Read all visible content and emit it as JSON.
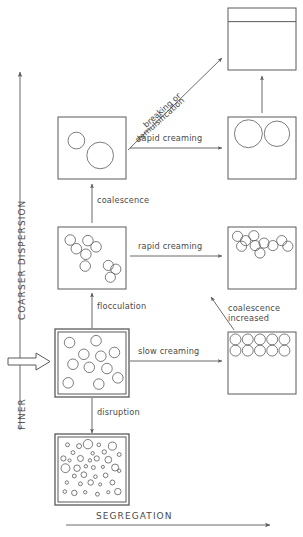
{
  "diagram": {
    "axes": {
      "vertical": {
        "top_label": "COARSER DISPERSION",
        "bottom_label": "FINER",
        "direction": "up",
        "name": "dispersion-axis"
      },
      "horizontal": {
        "label": "SEGREGATION",
        "direction": "right",
        "name": "segregation-axis"
      }
    },
    "input_arrow": {
      "name": "input-block-arrow",
      "points_to": "initial-emulsion"
    },
    "states": [
      {
        "id": "separated-phases",
        "name": "state-separated-phases",
        "caption": "",
        "x": 228,
        "y": 8,
        "w": 68,
        "h": 62,
        "kind": "two-phase",
        "phase_line_y": 0.22,
        "droplets": []
      },
      {
        "id": "coalesced-drops",
        "name": "state-coalesced-drops",
        "caption": "",
        "x": 58,
        "y": 117,
        "w": 68,
        "h": 62,
        "kind": "droplets",
        "droplets": [
          {
            "cx": 0.27,
            "cy": 0.38,
            "r": 0.135
          },
          {
            "cx": 0.62,
            "cy": 0.62,
            "r": 0.215
          }
        ]
      },
      {
        "id": "creamed-coalesced",
        "name": "state-creamed-coalesced",
        "caption": "",
        "x": 228,
        "y": 117,
        "w": 68,
        "h": 62,
        "kind": "droplets",
        "droplets": [
          {
            "cx": 0.3,
            "cy": 0.27,
            "r": 0.225
          },
          {
            "cx": 0.72,
            "cy": 0.27,
            "r": 0.205
          }
        ]
      },
      {
        "id": "flocculated",
        "name": "state-flocculated",
        "caption": "",
        "x": 58,
        "y": 227,
        "w": 68,
        "h": 62,
        "kind": "droplets",
        "droplets": [
          {
            "cx": 0.18,
            "cy": 0.21,
            "r": 0.085
          },
          {
            "cx": 0.27,
            "cy": 0.35,
            "r": 0.085
          },
          {
            "cx": 0.41,
            "cy": 0.44,
            "r": 0.085
          },
          {
            "cx": 0.44,
            "cy": 0.22,
            "r": 0.085
          },
          {
            "cx": 0.56,
            "cy": 0.32,
            "r": 0.085
          },
          {
            "cx": 0.4,
            "cy": 0.63,
            "r": 0.085
          },
          {
            "cx": 0.74,
            "cy": 0.62,
            "r": 0.082
          },
          {
            "cx": 0.85,
            "cy": 0.68,
            "r": 0.082
          },
          {
            "cx": 0.77,
            "cy": 0.81,
            "r": 0.082
          }
        ]
      },
      {
        "id": "flocculated-creamed",
        "name": "state-flocculated-creamed",
        "caption": "",
        "x": 228,
        "y": 227,
        "w": 68,
        "h": 62,
        "kind": "droplets",
        "droplets": [
          {
            "cx": 0.14,
            "cy": 0.15,
            "r": 0.082
          },
          {
            "cx": 0.26,
            "cy": 0.22,
            "r": 0.082
          },
          {
            "cx": 0.38,
            "cy": 0.14,
            "r": 0.082
          },
          {
            "cx": 0.4,
            "cy": 0.3,
            "r": 0.082
          },
          {
            "cx": 0.2,
            "cy": 0.31,
            "r": 0.082
          },
          {
            "cx": 0.53,
            "cy": 0.26,
            "r": 0.082
          },
          {
            "cx": 0.66,
            "cy": 0.3,
            "r": 0.082
          },
          {
            "cx": 0.79,
            "cy": 0.22,
            "r": 0.082
          },
          {
            "cx": 0.88,
            "cy": 0.31,
            "r": 0.082
          },
          {
            "cx": 0.47,
            "cy": 0.42,
            "r": 0.082
          }
        ]
      },
      {
        "id": "initial-emulsion",
        "name": "state-initial-emulsion",
        "caption": "",
        "x": 58,
        "y": 332,
        "w": 68,
        "h": 62,
        "kind": "droplets",
        "highlighted": true,
        "droplets": [
          {
            "cx": 0.17,
            "cy": 0.17,
            "r": 0.085
          },
          {
            "cx": 0.56,
            "cy": 0.14,
            "r": 0.085
          },
          {
            "cx": 0.38,
            "cy": 0.36,
            "r": 0.085
          },
          {
            "cx": 0.63,
            "cy": 0.39,
            "r": 0.085
          },
          {
            "cx": 0.83,
            "cy": 0.33,
            "r": 0.085
          },
          {
            "cx": 0.22,
            "cy": 0.52,
            "r": 0.085
          },
          {
            "cx": 0.46,
            "cy": 0.57,
            "r": 0.085
          },
          {
            "cx": 0.72,
            "cy": 0.59,
            "r": 0.085
          },
          {
            "cx": 0.15,
            "cy": 0.82,
            "r": 0.085
          },
          {
            "cx": 0.6,
            "cy": 0.84,
            "r": 0.085
          },
          {
            "cx": 0.88,
            "cy": 0.74,
            "r": 0.085
          }
        ]
      },
      {
        "id": "creamed-packed",
        "name": "state-creamed-packed",
        "caption": "",
        "x": 228,
        "y": 332,
        "w": 68,
        "h": 62,
        "kind": "droplets",
        "droplets": [
          {
            "cx": 0.11,
            "cy": 0.12,
            "r": 0.088
          },
          {
            "cx": 0.29,
            "cy": 0.12,
            "r": 0.088
          },
          {
            "cx": 0.47,
            "cy": 0.12,
            "r": 0.088
          },
          {
            "cx": 0.65,
            "cy": 0.12,
            "r": 0.088
          },
          {
            "cx": 0.83,
            "cy": 0.12,
            "r": 0.088
          },
          {
            "cx": 0.11,
            "cy": 0.3,
            "r": 0.088
          },
          {
            "cx": 0.29,
            "cy": 0.3,
            "r": 0.088
          },
          {
            "cx": 0.47,
            "cy": 0.3,
            "r": 0.088
          },
          {
            "cx": 0.65,
            "cy": 0.3,
            "r": 0.088
          },
          {
            "cx": 0.83,
            "cy": 0.3,
            "r": 0.088
          }
        ]
      },
      {
        "id": "finely-dispersed",
        "name": "state-finely-dispersed",
        "caption": "",
        "x": 58,
        "y": 437,
        "w": 68,
        "h": 65,
        "kind": "droplets",
        "highlighted": true,
        "droplets": [
          {
            "cx": 0.14,
            "cy": 0.12,
            "r": 0.03
          },
          {
            "cx": 0.31,
            "cy": 0.14,
            "r": 0.038
          },
          {
            "cx": 0.44,
            "cy": 0.11,
            "r": 0.072
          },
          {
            "cx": 0.6,
            "cy": 0.12,
            "r": 0.028
          },
          {
            "cx": 0.8,
            "cy": 0.14,
            "r": 0.062
          },
          {
            "cx": 0.22,
            "cy": 0.24,
            "r": 0.03
          },
          {
            "cx": 0.51,
            "cy": 0.25,
            "r": 0.026
          },
          {
            "cx": 0.68,
            "cy": 0.23,
            "r": 0.034
          },
          {
            "cx": 0.9,
            "cy": 0.27,
            "r": 0.03
          },
          {
            "cx": 0.08,
            "cy": 0.33,
            "r": 0.04
          },
          {
            "cx": 0.17,
            "cy": 0.36,
            "r": 0.024
          },
          {
            "cx": 0.33,
            "cy": 0.33,
            "r": 0.046
          },
          {
            "cx": 0.47,
            "cy": 0.36,
            "r": 0.026
          },
          {
            "cx": 0.57,
            "cy": 0.33,
            "r": 0.04
          },
          {
            "cx": 0.74,
            "cy": 0.35,
            "r": 0.052
          },
          {
            "cx": 0.11,
            "cy": 0.48,
            "r": 0.068
          },
          {
            "cx": 0.28,
            "cy": 0.48,
            "r": 0.05
          },
          {
            "cx": 0.41,
            "cy": 0.45,
            "r": 0.026
          },
          {
            "cx": 0.52,
            "cy": 0.47,
            "r": 0.03
          },
          {
            "cx": 0.66,
            "cy": 0.46,
            "r": 0.024
          },
          {
            "cx": 0.84,
            "cy": 0.47,
            "r": 0.054
          },
          {
            "cx": 0.9,
            "cy": 0.52,
            "r": 0.026
          },
          {
            "cx": 0.24,
            "cy": 0.6,
            "r": 0.03
          },
          {
            "cx": 0.38,
            "cy": 0.58,
            "r": 0.044
          },
          {
            "cx": 0.55,
            "cy": 0.61,
            "r": 0.028
          },
          {
            "cx": 0.7,
            "cy": 0.59,
            "r": 0.036
          },
          {
            "cx": 0.13,
            "cy": 0.7,
            "r": 0.026
          },
          {
            "cx": 0.33,
            "cy": 0.72,
            "r": 0.03
          },
          {
            "cx": 0.48,
            "cy": 0.7,
            "r": 0.042
          },
          {
            "cx": 0.62,
            "cy": 0.73,
            "r": 0.024
          },
          {
            "cx": 0.8,
            "cy": 0.7,
            "r": 0.038
          },
          {
            "cx": 0.1,
            "cy": 0.84,
            "r": 0.028
          },
          {
            "cx": 0.24,
            "cy": 0.86,
            "r": 0.042
          },
          {
            "cx": 0.4,
            "cy": 0.85,
            "r": 0.026
          },
          {
            "cx": 0.58,
            "cy": 0.88,
            "r": 0.03
          },
          {
            "cx": 0.74,
            "cy": 0.85,
            "r": 0.024
          },
          {
            "cx": 0.88,
            "cy": 0.84,
            "r": 0.05
          }
        ]
      }
    ],
    "transitions": [
      {
        "id": "coalescence",
        "name": "transition-coalescence",
        "label": "coalescence"
      },
      {
        "id": "flocculation",
        "name": "transition-flocculation",
        "label": "flocculation"
      },
      {
        "id": "disruption",
        "name": "transition-disruption",
        "label": "disruption"
      },
      {
        "id": "slow-creaming",
        "name": "transition-slow-creaming",
        "label": "slow creaming"
      },
      {
        "id": "rapid-creaming-floc",
        "name": "transition-rapid-creaming-floc",
        "label": "rapid creaming"
      },
      {
        "id": "rapid-creaming-coal",
        "name": "transition-rapid-creaming-coal",
        "label": "rapid creaming"
      },
      {
        "id": "breaking",
        "name": "transition-breaking",
        "label_line1": "breaking or",
        "label_line2": "demulsification"
      },
      {
        "id": "coalescence-increased",
        "name": "transition-coalescence-increased",
        "label_line1": "coalescence",
        "label_line2": "increased"
      }
    ],
    "colors": {
      "stroke": "#5a5a5a",
      "text": "#4a4a4a",
      "background": "#ffffff"
    }
  }
}
